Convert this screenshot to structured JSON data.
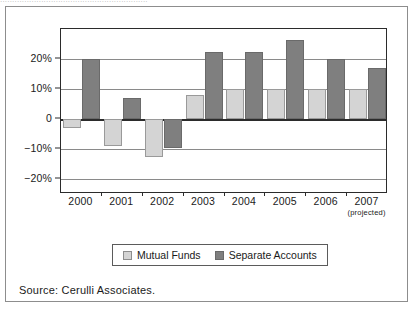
{
  "caption_strip": {
    "text": "............................................................."
  },
  "chart_data": {
    "type": "bar",
    "title": "",
    "subtitle": "",
    "xlabel": "",
    "ylabel": "",
    "categories": [
      "2000",
      "2001",
      "2002",
      "2003",
      "2004",
      "2005",
      "2006",
      "2007"
    ],
    "category_sublabels": [
      "",
      "",
      "",
      "",
      "",
      "",
      "",
      "(projected)"
    ],
    "series": [
      {
        "name": "Mutual Funds",
        "color": "#d4d4d4",
        "values": [
          -3,
          -9,
          -12.5,
          8,
          10,
          10,
          10,
          10
        ]
      },
      {
        "name": "Separate Accounts",
        "color": "#7f7f7f",
        "values": [
          20,
          7,
          -9.5,
          22.5,
          22.5,
          26.5,
          20,
          17
        ]
      }
    ],
    "ylim": [
      -25,
      30
    ],
    "yticks": [
      20,
      10,
      0,
      -10,
      -20
    ],
    "ytick_labels": [
      "20%",
      "10%",
      "0",
      "−10%",
      "−20%"
    ],
    "grid": true,
    "legend_position": "bottom-center",
    "value_unit": "percent"
  },
  "legend": {
    "items": [
      {
        "label": "Mutual Funds",
        "swatch": "mf"
      },
      {
        "label": "Separate Accounts",
        "swatch": "sa"
      }
    ]
  },
  "source": {
    "text": "Source: Cerulli Associates."
  }
}
